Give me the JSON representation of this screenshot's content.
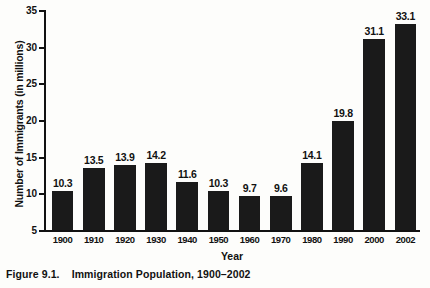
{
  "caption": {
    "number": "Figure 9.1.",
    "text": "Immigration Population, 1900–2002"
  },
  "chart_data": {
    "type": "bar",
    "title": "",
    "xlabel": "Year",
    "ylabel": "Number of Immigrants (in millions)",
    "categories": [
      "1900",
      "1910",
      "1920",
      "1930",
      "1940",
      "1950",
      "1960",
      "1970",
      "1980",
      "1990",
      "2000",
      "2002"
    ],
    "values": [
      10.3,
      13.5,
      13.9,
      14.2,
      11.6,
      10.3,
      9.7,
      9.6,
      14.1,
      19.8,
      31.1,
      33.1
    ],
    "value_labels": [
      "10.3",
      "13.5",
      "13.9",
      "14.2",
      "11.6",
      "10.3",
      "9.7",
      "9.6",
      "14.1",
      "19.8",
      "31.1",
      "33.1"
    ],
    "ylim": [
      5,
      35
    ],
    "yticks": [
      5,
      10,
      15,
      20,
      25,
      30,
      35
    ],
    "ytick_labels": [
      "5",
      "10",
      "15",
      "20",
      "25",
      "30",
      "35"
    ],
    "grid": false,
    "legend": null,
    "bar_color": "#1a1a1a"
  }
}
